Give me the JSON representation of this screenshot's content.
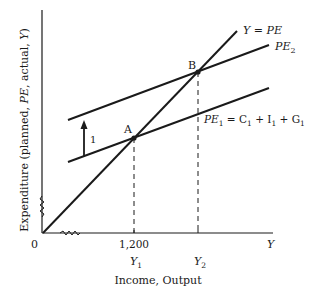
{
  "diagram": {
    "type": "keynesian-cross",
    "axes": {
      "y_label": {
        "prefix": "Expenditure (planned, ",
        "pe": "PE",
        "mid": ", actual, ",
        "y": "Y",
        "suffix": ")"
      },
      "x_label": "Income, Output",
      "x_axis_end_label": "Y",
      "origin_label": "0"
    },
    "lines": {
      "forty_five": {
        "label_left": "Y",
        "label_eq": " = ",
        "label_right": "PE"
      },
      "pe2": {
        "label": "PE",
        "sub": "2"
      },
      "pe1": {
        "label": "PE",
        "sub": "1",
        "eq": " = C",
        "c_sub": "1",
        "plus_i": " + I",
        "i_sub": "1",
        "plus_g": " + G",
        "g_sub": "1"
      }
    },
    "points": {
      "a": {
        "label": "A"
      },
      "b": {
        "label": "B"
      }
    },
    "ticks": {
      "y1_value": "1,200",
      "y1": {
        "label": "Y",
        "sub": "1"
      },
      "y2": {
        "label": "Y",
        "sub": "2"
      }
    },
    "shift_arrow_label": "1",
    "colors": {
      "ink": "#1a1a1a",
      "background": "#ffffff"
    }
  }
}
